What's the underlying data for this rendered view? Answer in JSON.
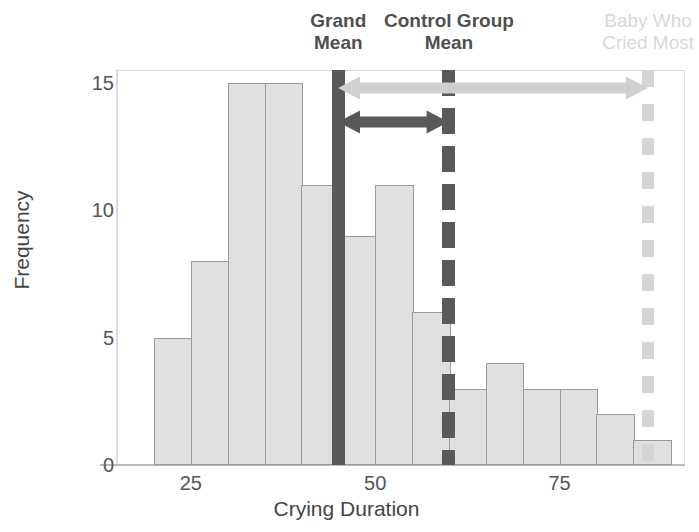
{
  "chart_data": {
    "type": "bar",
    "title": "",
    "xlabel": "Crying Duration",
    "ylabel": "Frequency",
    "xlim": [
      15,
      92
    ],
    "ylim": [
      0,
      15.5
    ],
    "grid": false,
    "bin_width": 5,
    "categories": [
      "20-25",
      "25-30",
      "30-35",
      "35-40",
      "40-45",
      "45-50",
      "50-55",
      "55-60",
      "60-65",
      "65-70",
      "70-75",
      "75-80",
      "80-85",
      "85-90"
    ],
    "bin_starts": [
      20,
      25,
      30,
      35,
      40,
      45,
      50,
      55,
      60,
      65,
      70,
      75,
      80,
      85
    ],
    "values": [
      5,
      8,
      15,
      15,
      11,
      9,
      11,
      6,
      3,
      4,
      3,
      3,
      2,
      1
    ],
    "xticks": [
      25,
      50,
      75
    ],
    "xtick_labels": [
      "25",
      "50",
      "75"
    ],
    "yticks": [
      0,
      5,
      10,
      15
    ],
    "ytick_labels": [
      "0",
      "5",
      "10",
      "15"
    ],
    "annotations": [
      {
        "name": "grand-mean",
        "label": "Grand\nMean",
        "x": 45,
        "style": "solid",
        "color": "#595959"
      },
      {
        "name": "control-group-mean",
        "label": "Control Group\nMean",
        "x": 60,
        "style": "dashed",
        "color": "#595959"
      },
      {
        "name": "baby-who-cried-most",
        "label": "Baby Who\nCried Most",
        "x": 87,
        "style": "dotted",
        "color": "#d8d8d8"
      }
    ],
    "arrows": [
      {
        "name": "grand-mean-to-baby",
        "from_x": 45,
        "to_x": 87,
        "color": "#cfcfcf",
        "double_headed": true
      },
      {
        "name": "grand-mean-to-control-mean",
        "from_x": 45,
        "to_x": 60,
        "color": "#595959",
        "double_headed": true
      }
    ],
    "colors": {
      "bar_fill": "#e0e0e0",
      "bar_stroke": "#9a9a9a",
      "dark_accent": "#595959",
      "light_accent": "#d8d8d8",
      "axis": "#b9b9b9",
      "text": "#555555"
    }
  }
}
